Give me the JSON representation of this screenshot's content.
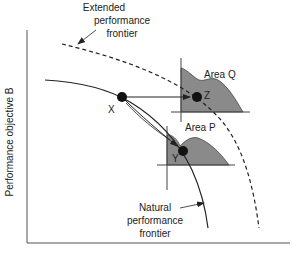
{
  "diagram": {
    "y_axis_label": "Performance objective B",
    "extended_frontier": {
      "line1": "Extended",
      "line2": "performance",
      "line3": "frontier"
    },
    "natural_frontier": {
      "line1": "Natural",
      "line2": "performance",
      "line3": "frontier"
    },
    "points": {
      "x": "X",
      "y": "Y",
      "z": "Z"
    },
    "areas": {
      "q": "Area Q",
      "p": "Area P"
    },
    "colors": {
      "area_fill": "#8a8a8a",
      "line": "#222222",
      "axis": "#555555"
    }
  }
}
